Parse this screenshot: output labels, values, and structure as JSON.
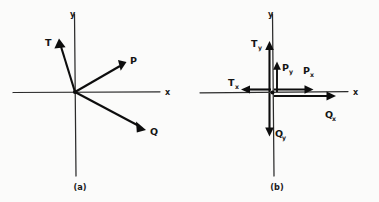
{
  "figure": {
    "background_color": "#fbfbfa",
    "ink_color": "#0d0d0d",
    "panels": [
      {
        "id": "a",
        "caption": "(a)",
        "axes": {
          "x_label": "x",
          "y_label": "y"
        },
        "vectors": [
          {
            "name": "T",
            "label": "T",
            "subscript": "",
            "direction": "up-left",
            "angle_deg": 108
          },
          {
            "name": "P",
            "label": "P",
            "subscript": "",
            "direction": "up-right",
            "angle_deg": 28
          },
          {
            "name": "Q",
            "label": "Q",
            "subscript": "",
            "direction": "down-right",
            "angle_deg": -32
          }
        ]
      },
      {
        "id": "b",
        "caption": "(b)",
        "axes": {
          "x_label": "x",
          "y_label": "y"
        },
        "vectors": [
          {
            "name": "Ty",
            "label": "T",
            "subscript": "y",
            "direction": "up",
            "axis": "y"
          },
          {
            "name": "Tx",
            "label": "T",
            "subscript": "x",
            "direction": "left",
            "axis": "x"
          },
          {
            "name": "Py",
            "label": "P",
            "subscript": "y",
            "direction": "up",
            "axis": "y"
          },
          {
            "name": "Px",
            "label": "P",
            "subscript": "x",
            "direction": "right",
            "axis": "x"
          },
          {
            "name": "Qy",
            "label": "Q",
            "subscript": "y",
            "direction": "down",
            "axis": "y"
          },
          {
            "name": "Qx",
            "label": "Q",
            "subscript": "x",
            "direction": "right",
            "axis": "x"
          }
        ]
      }
    ]
  },
  "labels": {
    "panel_a": {
      "axis_x": "x",
      "axis_y": "y",
      "vec_T": "T",
      "vec_P": "P",
      "vec_Q": "Q",
      "caption": "(a)"
    },
    "panel_b": {
      "axis_x": "x",
      "axis_y": "y",
      "vec_T": "T",
      "sub_Ty": "y",
      "sub_Tx": "x",
      "vec_P": "P",
      "sub_Py": "y",
      "sub_Px": "x",
      "vec_Q": "Q",
      "sub_Qy": "y",
      "sub_Qx": "x",
      "caption": "(b)"
    }
  }
}
